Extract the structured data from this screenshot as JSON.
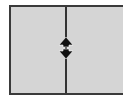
{
  "splitter": {
    "orientation": "vertical",
    "left_pane": {},
    "right_pane": {}
  },
  "cursor": {
    "icon": "resize-vertical-cursor-icon",
    "color": "#111111"
  },
  "colors": {
    "pane_background": "#d5d5d5",
    "border": "#3a3a3a",
    "divider": "#333333"
  }
}
